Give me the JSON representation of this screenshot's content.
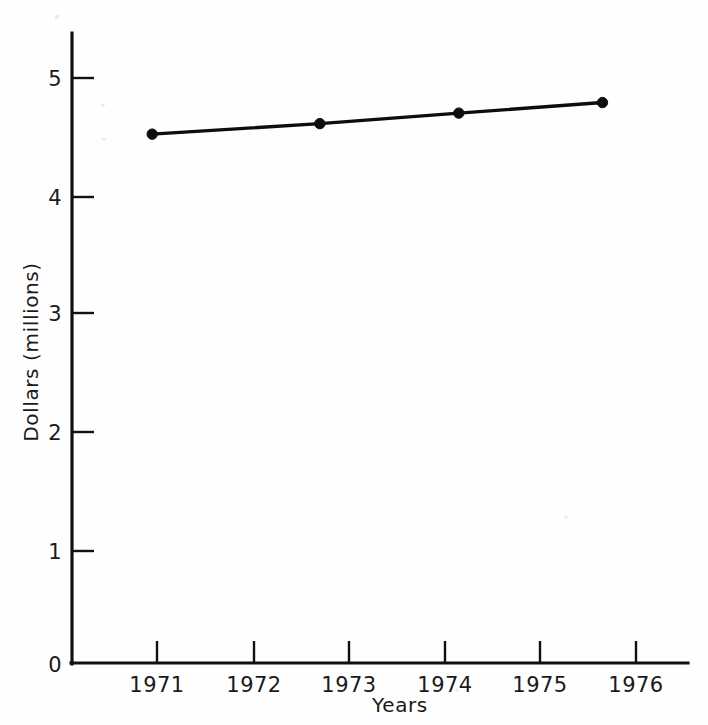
{
  "chart_data": {
    "type": "line",
    "title": "",
    "xlabel": "Years",
    "ylabel": "Dollars (millions)",
    "xlim": [
      1970.35,
      1976.55
    ],
    "ylim": [
      0,
      5.45
    ],
    "grid": false,
    "legend": "none",
    "x_tick_labels": [
      "1971",
      "1972",
      "1973",
      "1974",
      "1975",
      "1976"
    ],
    "x_tick_values": [
      1971,
      1972,
      1973,
      1974,
      1975,
      1976
    ],
    "y_tick_labels": [
      "0",
      "1",
      "2",
      "3",
      "4",
      "5"
    ],
    "y_tick_values": [
      0,
      1,
      2,
      3,
      4,
      5
    ],
    "series": [
      {
        "name": "Dollars (millions)",
        "x": [
          1970.95,
          1972.7,
          1974.15,
          1975.65
        ],
        "values": [
          4.52,
          4.61,
          4.7,
          4.79
        ],
        "marker": "filled-circle",
        "color": "#0d0d0d"
      }
    ]
  },
  "axes": {
    "y_axis_name": "y-axis",
    "x_axis_name": "x-axis"
  },
  "yticks": [
    {
      "label": "5",
      "value": 5
    },
    {
      "label": "4",
      "value": 4
    },
    {
      "label": "3",
      "value": 3
    },
    {
      "label": "2",
      "value": 2
    },
    {
      "label": "1",
      "value": 1
    },
    {
      "label": "0",
      "value": 0
    }
  ],
  "xticks": [
    {
      "label": "1971",
      "value": 1971
    },
    {
      "label": "1972",
      "value": 1972
    },
    {
      "label": "1973",
      "value": 1973
    },
    {
      "label": "1974",
      "value": 1974
    },
    {
      "label": "1975",
      "value": 1975
    },
    {
      "label": "1976",
      "value": 1976
    }
  ],
  "labels": {
    "xlabel": "Years",
    "ylabel": "Dollars (millions)"
  },
  "colors": {
    "ink": "#111111",
    "series": "#0d0d0d",
    "background": "#fefefe"
  }
}
